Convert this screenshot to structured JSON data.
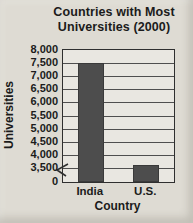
{
  "chart_data": {
    "type": "bar",
    "title": "Countries with Most Universities (2000)",
    "xlabel": "Country",
    "ylabel": "Universities",
    "categories": [
      "India",
      "U.S."
    ],
    "values": [
      7500,
      3600
    ],
    "yticks": [
      0,
      3500,
      4000,
      4500,
      5000,
      5500,
      6000,
      6500,
      7000,
      7500,
      8000
    ],
    "ylim": [
      3500,
      8000
    ],
    "axis_break_between": [
      0,
      3500
    ],
    "grid": "horizontal",
    "legend": "none",
    "bar_color": "#4d4d4d",
    "colors": {
      "page_background": "#dedbd3",
      "plot_background": "#e9e7e1",
      "gridline": "#4f4f4f",
      "axis_border": "#2f2f2f",
      "text": "#1b1b1b"
    }
  }
}
